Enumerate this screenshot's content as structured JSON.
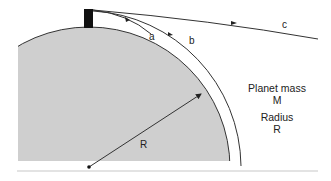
{
  "diagram": {
    "trajectories": [
      {
        "id": "a",
        "label": "a",
        "description": "falls back to surface"
      },
      {
        "id": "b",
        "label": "b",
        "description": "circular orbit"
      },
      {
        "id": "c",
        "label": "c",
        "description": "escape trajectory"
      }
    ],
    "radius_label": "R",
    "info": {
      "mass_label": "Planet mass",
      "mass_symbol": "M",
      "radius_label": "Radius",
      "radius_symbol": "R"
    },
    "colors": {
      "planet_fill": "#cfcfcf",
      "outline": "#333333",
      "tower": "#111111",
      "baseline": "#e6e6e6"
    }
  }
}
